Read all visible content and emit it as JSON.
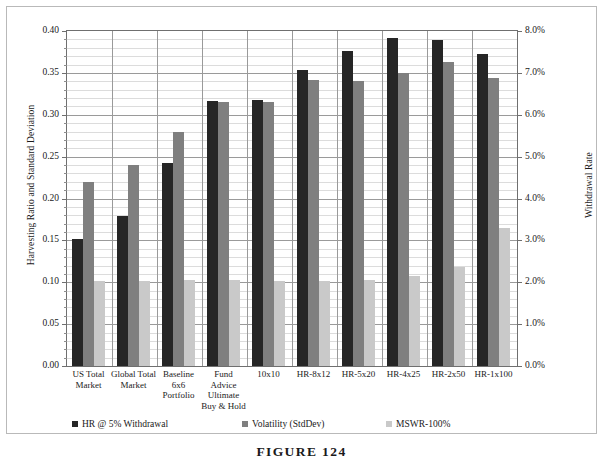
{
  "figure": {
    "caption": "FIGURE 124"
  },
  "chart_data": {
    "type": "bar",
    "title": "",
    "subtitle": "",
    "xlabel": "",
    "ylabel": "Harvesting Ratio and Standard Deviation",
    "y2label": "Withdrawal Rate",
    "ylim": [
      0.0,
      0.4
    ],
    "y2lim": [
      0.0,
      8.0
    ],
    "grid": true,
    "legend_position": "bottom",
    "ytick_labels": [
      "0.00",
      "0.05",
      "0.10",
      "0.15",
      "0.20",
      "0.25",
      "0.30",
      "0.35",
      "0.40"
    ],
    "ytick_values": [
      0.0,
      0.05,
      0.1,
      0.15,
      0.2,
      0.25,
      0.3,
      0.35,
      0.4
    ],
    "y2tick_labels": [
      "0.0%",
      "1.0%",
      "2.0%",
      "3.0%",
      "4.0%",
      "5.0%",
      "6.0%",
      "7.0%",
      "8.0%"
    ],
    "y2tick_values": [
      0.0,
      1.0,
      2.0,
      3.0,
      4.0,
      5.0,
      6.0,
      7.0,
      8.0
    ],
    "minor_tick_interval": 0.01,
    "categories": [
      "US Total Market",
      "Global Total Market",
      "Baseline 6x6 Portfolio",
      "Fund Advice Ultimate Buy & Hold",
      "10x10",
      "HR-8x12",
      "HR-5x20",
      "HR-4x25",
      "HR-2x50",
      "HR-1x100"
    ],
    "category_lines": [
      [
        "US Total",
        "Market"
      ],
      [
        "Global Total",
        "Market"
      ],
      [
        "Baseline",
        "6x6",
        "Portfolio"
      ],
      [
        "Fund",
        "Advice",
        "Ultimate",
        "Buy & Hold"
      ],
      [
        "10x10"
      ],
      [
        "HR-8x12"
      ],
      [
        "HR-5x20"
      ],
      [
        "HR-4x25"
      ],
      [
        "HR-2x50"
      ],
      [
        "HR-1x100"
      ]
    ],
    "series": [
      {
        "name": "HR @ 5% Withdrawal",
        "color": "#262626",
        "axis": "left",
        "values": [
          0.152,
          0.179,
          0.242,
          0.316,
          0.318,
          0.354,
          0.376,
          0.392,
          0.389,
          0.372
        ]
      },
      {
        "name": "Volatility (StdDev)",
        "color": "#7f7f7f",
        "axis": "left",
        "values": [
          0.22,
          0.24,
          0.28,
          0.315,
          0.315,
          0.341,
          0.34,
          0.35,
          0.363,
          0.344
        ]
      },
      {
        "name": "MSWR-100%",
        "color": "#c9c9c9",
        "axis": "right",
        "values_left_scale": [
          0.101,
          0.101,
          0.103,
          0.103,
          0.101,
          0.101,
          0.103,
          0.108,
          0.118,
          0.165
        ],
        "values": [
          2.02,
          2.02,
          2.06,
          2.06,
          2.02,
          2.02,
          2.06,
          2.16,
          2.36,
          3.3
        ]
      }
    ]
  }
}
